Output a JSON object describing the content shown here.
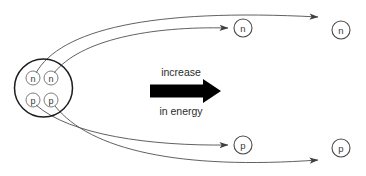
{
  "diagram": {
    "background_color": "#ffffff",
    "nucleus": {
      "label": "nucleus",
      "outline_color": "#1c1c1c",
      "contents": [
        {
          "id": "nucleus-neutron-1",
          "symbol": "n",
          "type": "neutron",
          "cx": 33,
          "cy": 78,
          "r": 7
        },
        {
          "id": "nucleus-neutron-2",
          "symbol": "n",
          "type": "neutron",
          "cx": 51,
          "cy": 78,
          "r": 7
        },
        {
          "id": "nucleus-proton-1",
          "symbol": "p",
          "type": "proton",
          "cx": 33,
          "cy": 100,
          "r": 7
        },
        {
          "id": "nucleus-proton-2",
          "symbol": "p",
          "type": "proton",
          "cx": 51,
          "cy": 100,
          "r": 7
        }
      ]
    },
    "emitted_particles": [
      {
        "id": "emitted-neutron-near",
        "symbol": "n",
        "type": "neutron",
        "cx": 243,
        "cy": 28,
        "r": 9
      },
      {
        "id": "emitted-neutron-far",
        "symbol": "n",
        "type": "neutron",
        "cx": 341,
        "cy": 30,
        "r": 9
      },
      {
        "id": "emitted-proton-near",
        "symbol": "p",
        "type": "proton",
        "cx": 243,
        "cy": 145,
        "r": 9
      },
      {
        "id": "emitted-proton-far",
        "symbol": "p",
        "type": "proton",
        "cx": 341,
        "cy": 148,
        "r": 9
      }
    ],
    "trajectories": [
      {
        "id": "trajectory-neutron-long",
        "from": "nucleus-neutron-1",
        "to": "emitted-neutron-far",
        "path": "M 36 73 C 60 30, 150 8, 318 17"
      },
      {
        "id": "trajectory-neutron-short",
        "from": "nucleus-neutron-2",
        "to": "emitted-neutron-near",
        "path": "M 54 73 C 80 40, 150 26, 228 28"
      },
      {
        "id": "trajectory-proton-short",
        "from": "nucleus-proton-1",
        "to": "emitted-proton-near",
        "path": "M 36 105 C 70 135, 150 146, 228 145"
      },
      {
        "id": "trajectory-proton-long",
        "from": "nucleus-proton-2",
        "to": "emitted-proton-far",
        "path": "M 55 106 C 90 150, 180 170, 318 160"
      }
    ],
    "energy_arrow": {
      "label_top": "increase",
      "label_bottom": "in energy",
      "color": "#000000",
      "direction": "right"
    }
  }
}
